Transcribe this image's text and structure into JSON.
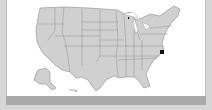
{
  "map": {
    "title": "United States",
    "highlighted_region": "Virginia / Delmarva area",
    "colors": {
      "land": "#d0d0d0",
      "border": "#7a7a7a",
      "highlight": "#111111",
      "panel": "#ffffff",
      "background": "#d6d6d6",
      "bar": "#a9a9a9"
    },
    "scale_label": "ᵤₘₚ"
  }
}
